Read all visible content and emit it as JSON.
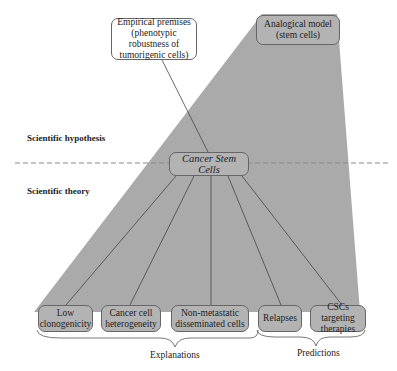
{
  "colors": {
    "cone_fill": "#aaaaaa",
    "box_fill_gray": "#b3b3b3",
    "box_fill_white": "#ffffff",
    "border": "#666666",
    "dashed_line": "#888888"
  },
  "top": {
    "empirical_premises": {
      "line1": "Empirical premises",
      "line2": "(phenotypic robustness of",
      "line3": "tumorigenic cells)"
    },
    "analogical_model": {
      "line1": "Analogical model",
      "line2": "(stem cells)"
    }
  },
  "levels": {
    "hypothesis": "Scientific hypothesis",
    "theory": "Scientific theory"
  },
  "center": {
    "label": "Cancer Stem Cells"
  },
  "bottom_boxes": [
    {
      "line1": "Low",
      "line2": "clonogenicity"
    },
    {
      "line1": "Cancer cell",
      "line2": "heterogeneity"
    },
    {
      "line1": "Non-metastatic",
      "line2": "disseminated cells"
    },
    {
      "line1": "Relapses",
      "line2": ""
    },
    {
      "line1": "CSCs targeting",
      "line2": "therapies"
    }
  ],
  "groups": {
    "explanations": "Explanations",
    "predictions": "Predictions"
  }
}
